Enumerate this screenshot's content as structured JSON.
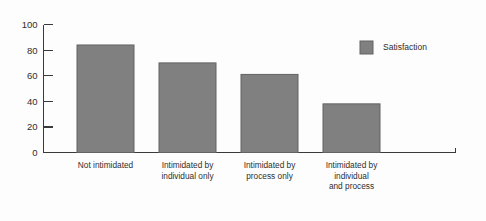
{
  "chart_data": {
    "type": "bar",
    "title": "",
    "subtitle": "",
    "xlabel": "",
    "ylabel": "",
    "ylim": [
      0,
      100
    ],
    "yticks": [
      0,
      20,
      40,
      60,
      80,
      100
    ],
    "ytick_labels": [
      "0",
      "20",
      "40",
      "60",
      "80",
      "100"
    ],
    "grid": false,
    "legend_position": "top-right",
    "categories": [
      "Not intimidated",
      "Intimidated by individual only",
      "Intimidated by process only",
      "Intimidated by individual and process"
    ],
    "category_lines": [
      [
        "Not intimidated"
      ],
      [
        "Intimidated by",
        "individual only"
      ],
      [
        "Intimidated by",
        "process only"
      ],
      [
        "Intimidated by",
        "individual",
        "and process"
      ]
    ],
    "series": [
      {
        "name": "Satisfaction",
        "values": [
          84,
          70,
          61,
          38
        ],
        "color": "#808080"
      }
    ]
  },
  "legend": {
    "entries": [
      {
        "label": "Satisfaction",
        "color": "#808080"
      }
    ]
  },
  "colors": {
    "bar_fill": "#808080",
    "bar_stroke": "#636363",
    "axis": "#3a3a3a",
    "text": "#2e2e2e",
    "background": "#fdfdfd"
  }
}
